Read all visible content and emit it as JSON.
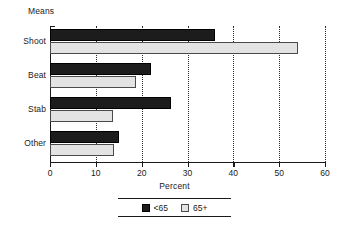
{
  "chart_data": {
    "type": "bar",
    "orientation": "horizontal",
    "title": "",
    "xlabel": "Percent",
    "ylabel": "Means",
    "xlim": [
      0,
      60
    ],
    "xticks": [
      0,
      10,
      20,
      30,
      40,
      50,
      60
    ],
    "grid": true,
    "legend_position": "bottom",
    "categories": [
      "Shoot",
      "Beat",
      "Stab",
      "Other"
    ],
    "series": [
      {
        "name": "<65",
        "color": "#1c1c1c",
        "values": [
          36,
          22,
          26.5,
          15
        ]
      },
      {
        "name": "65+",
        "color": "#e3e3e3",
        "values": [
          54,
          18.7,
          13.8,
          14
        ]
      }
    ]
  },
  "legend": {
    "entries": [
      {
        "label": "<65"
      },
      {
        "label": "65+"
      }
    ]
  }
}
